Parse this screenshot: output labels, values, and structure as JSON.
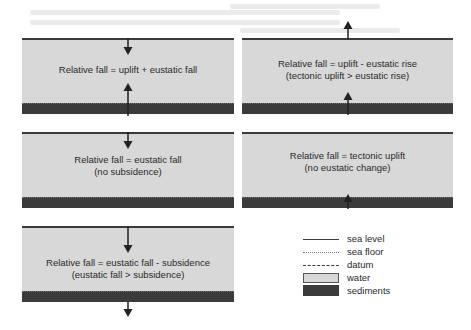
{
  "figure": {
    "panels": [
      {
        "id": "uplift-plus-eustatic-fall",
        "caption_lines": [
          "Relative fall = uplift + eustatic fall"
        ],
        "sea_level_arrow": "down",
        "basement_arrow": "up"
      },
      {
        "id": "uplift-minus-eustatic-rise",
        "caption_lines": [
          "Relative fall = uplift - eustatic rise",
          "(tectonic uplift > eustatic rise)"
        ],
        "sea_level_arrow": "up",
        "basement_arrow": "up"
      },
      {
        "id": "eustatic-fall-only",
        "caption_lines": [
          "Relative fall = eustatic fall",
          "(no subsidence)"
        ],
        "sea_level_arrow": "down",
        "basement_arrow": "none"
      },
      {
        "id": "tectonic-uplift-only",
        "caption_lines": [
          "Relative fall = tectonic uplift",
          "(no eustatic change)"
        ],
        "sea_level_arrow": "none",
        "basement_arrow": "up"
      },
      {
        "id": "eustatic-fall-minus-subsidence",
        "caption_lines": [
          "Relative fall = eustatic fall - subsidence",
          "(eustatic fall > subsidence)"
        ],
        "sea_level_arrow": "down",
        "basement_arrow": "down"
      }
    ],
    "legend": [
      {
        "key": "sea-level",
        "label": "sea level",
        "symbol": "solid-line"
      },
      {
        "key": "sea-floor",
        "label": "sea floor",
        "symbol": "dotted-line"
      },
      {
        "key": "datum",
        "label": "datum",
        "symbol": "dashed-line"
      },
      {
        "key": "water",
        "label": "water",
        "symbol": "light-gray-box"
      },
      {
        "key": "sediments",
        "label": "sediments",
        "symbol": "dark-gray-box"
      }
    ],
    "colors": {
      "water": "#d8d8d8",
      "sediments": "#3b3b3b",
      "line": "#3a3a3a",
      "text": "#2a2a2a"
    }
  }
}
